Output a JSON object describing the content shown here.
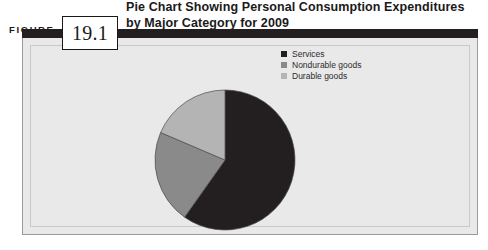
{
  "figure": {
    "label": "FIGURE",
    "number": "19.1",
    "title_line1": "Pie Chart Showing Personal Consumption Expenditures",
    "title_line2": "by Major Category for 2009"
  },
  "colors": {
    "header_bar": "#231f20",
    "panel_background": "#e9e9e9",
    "panel_border": "#9a9a9a",
    "inner_frame": "#c9c9c9",
    "services": "#231f20",
    "nondurable_goods": "#8a8a8a",
    "durable_goods": "#b4b4b4",
    "slice_outline": "#4a4a4a",
    "text": "#1a1a1a"
  },
  "legend": {
    "items": [
      {
        "label": "Services",
        "color": "#231f20"
      },
      {
        "label": "Nondurable goods",
        "color": "#8a8a8a"
      },
      {
        "label": "Durable goods",
        "color": "#b4b4b4"
      }
    ]
  },
  "chart_data": {
    "type": "pie",
    "title": "Pie Chart Showing Personal Consumption Expenditures by Major Category for 2009",
    "categories": [
      "Services",
      "Nondurable goods",
      "Durable goods"
    ],
    "values": [
      59.8,
      21.6,
      18.6
    ],
    "units": "percent",
    "slice_degrees": [
      215.3,
      77.8,
      66.9
    ],
    "colors": [
      "#231f20",
      "#8a8a8a",
      "#b4b4b4"
    ],
    "start_angle_deg": 0,
    "direction": "clockwise",
    "legend_position": "right",
    "grid": false,
    "xlabel": "",
    "ylabel": ""
  },
  "geometry": {
    "center_x": 92,
    "center_y": 92,
    "radius": 70
  }
}
